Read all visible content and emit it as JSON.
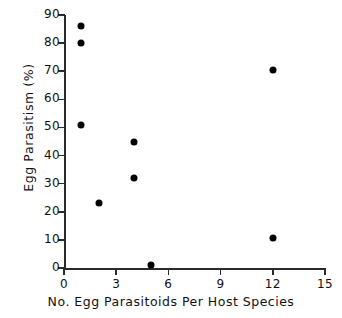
{
  "chart_data": {
    "type": "scatter",
    "title": "",
    "subtitle": "",
    "xlabel": "No. Egg Parasitoids Per Host Species",
    "ylabel": "Egg Parasitism (%)",
    "xlim": [
      0,
      15
    ],
    "ylim": [
      0,
      90
    ],
    "xticks": [
      0,
      3,
      6,
      9,
      12,
      15
    ],
    "yticks": [
      0,
      10,
      20,
      30,
      40,
      50,
      60,
      70,
      80,
      90
    ],
    "xtick_labels": [
      "0",
      "3",
      "6",
      "9",
      "12",
      "15"
    ],
    "ytick_labels": [
      "0",
      "10",
      "20",
      "30",
      "40",
      "50",
      "60",
      "70",
      "80",
      "90"
    ],
    "grid": false,
    "legend": null,
    "annotations": [],
    "marker": {
      "shape": "circle",
      "color": "#000000",
      "size_px": 7
    },
    "series": [
      {
        "name": "Egg parasitism by parasitoid richness",
        "color": "#000000",
        "points": [
          {
            "x": 1,
            "y": 86
          },
          {
            "x": 1,
            "y": 80
          },
          {
            "x": 1,
            "y": 51
          },
          {
            "x": 2,
            "y": 23
          },
          {
            "x": 4,
            "y": 45
          },
          {
            "x": 4,
            "y": 32
          },
          {
            "x": 5,
            "y": 1
          },
          {
            "x": 12,
            "y": 70.5
          },
          {
            "x": 12,
            "y": 10.5
          }
        ]
      }
    ]
  }
}
